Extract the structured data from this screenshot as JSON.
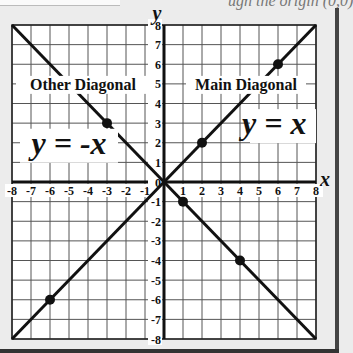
{
  "header": {
    "cut_title": "ugh the origin (0,0)"
  },
  "chart_data": {
    "type": "line",
    "title": "",
    "xlabel": "x",
    "ylabel": "y",
    "xlim": [
      -8,
      8
    ],
    "ylim": [
      -8,
      8
    ],
    "grid": true,
    "x_ticks": [
      "-8",
      "-7",
      "-6",
      "-5",
      "-4",
      "-3",
      "-2",
      "-1",
      "1",
      "2",
      "3",
      "4",
      "5",
      "6",
      "7",
      "8"
    ],
    "y_ticks": [
      "8",
      "7",
      "6",
      "5",
      "4",
      "3",
      "2",
      "1",
      "0",
      "-1",
      "-2",
      "-3",
      "-4",
      "-5",
      "-6",
      "-7",
      "-8"
    ],
    "series": [
      {
        "name": "Main Diagonal",
        "equation": "y = x",
        "x": [
          -8,
          8
        ],
        "y": [
          -8,
          8
        ],
        "points": [
          [
            -6,
            -6
          ],
          [
            2,
            2
          ],
          [
            6,
            6
          ]
        ]
      },
      {
        "name": "Other Diagonal",
        "equation": "y = -x",
        "x": [
          -8,
          8
        ],
        "y": [
          8,
          -8
        ],
        "points": [
          [
            -3,
            3
          ],
          [
            1,
            -1
          ],
          [
            4,
            -4
          ]
        ]
      }
    ],
    "annotations": [
      {
        "text": "Other Diagonal",
        "x": -5.3,
        "y": 5
      },
      {
        "text": "y = -x",
        "x": -5.8,
        "y": 2
      },
      {
        "text": "Main Diagonal",
        "x": 4,
        "y": 5
      },
      {
        "text": "y = x",
        "x": 5,
        "y": 3
      }
    ]
  }
}
